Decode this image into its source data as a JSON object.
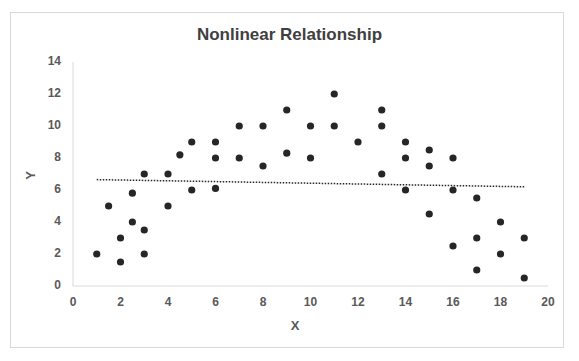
{
  "chart_data": {
    "type": "scatter",
    "title": "Nonlinear Relationship",
    "xlabel": "X",
    "ylabel": "Y",
    "xlim": [
      0,
      20
    ],
    "ylim": [
      0,
      14
    ],
    "x_ticks": [
      "0",
      "2",
      "4",
      "6",
      "8",
      "10",
      "12",
      "14",
      "16",
      "18",
      "20"
    ],
    "y_ticks": [
      "0",
      "2",
      "4",
      "6",
      "8",
      "10",
      "12",
      "14"
    ],
    "grid": false,
    "legend": "none",
    "series": [
      {
        "name": "Y",
        "marker": "circle",
        "color": "#262626",
        "points": [
          [
            1,
            2
          ],
          [
            1.5,
            5
          ],
          [
            2,
            3
          ],
          [
            2,
            1.5
          ],
          [
            2.5,
            5.8
          ],
          [
            2.5,
            4
          ],
          [
            3,
            7
          ],
          [
            3,
            3.5
          ],
          [
            3,
            2
          ],
          [
            4,
            7
          ],
          [
            4,
            5
          ],
          [
            4.5,
            8.2
          ],
          [
            5,
            9
          ],
          [
            5,
            6
          ],
          [
            6,
            9
          ],
          [
            6,
            8
          ],
          [
            6,
            6.1
          ],
          [
            7,
            10
          ],
          [
            7,
            8
          ],
          [
            8,
            10
          ],
          [
            8,
            7.5
          ],
          [
            9,
            11
          ],
          [
            9,
            8.3
          ],
          [
            10,
            10
          ],
          [
            10,
            8
          ],
          [
            11,
            12
          ],
          [
            11,
            10
          ],
          [
            12,
            9
          ],
          [
            13,
            11
          ],
          [
            13,
            10
          ],
          [
            13,
            7
          ],
          [
            14,
            9
          ],
          [
            14,
            8
          ],
          [
            14,
            6
          ],
          [
            15,
            8.5
          ],
          [
            15,
            7.5
          ],
          [
            15,
            4.5
          ],
          [
            16,
            8
          ],
          [
            16,
            6
          ],
          [
            16,
            2.5
          ],
          [
            17,
            5.5
          ],
          [
            17,
            3
          ],
          [
            17,
            1
          ],
          [
            18,
            4
          ],
          [
            18,
            2
          ],
          [
            19,
            3
          ],
          [
            19,
            0.5
          ]
        ]
      }
    ],
    "trendline": {
      "type": "linear",
      "style": "dotted",
      "color": "#262626",
      "start": [
        1,
        6.65
      ],
      "end": [
        19,
        6.2
      ]
    }
  }
}
